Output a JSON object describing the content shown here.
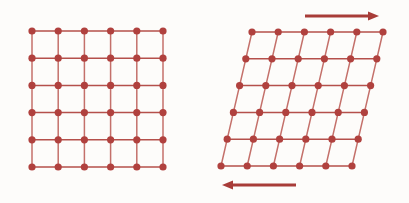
{
  "figure": {
    "background_color": "#fdfcfa",
    "width": 409,
    "height": 203,
    "panel_count": 2
  },
  "style": {
    "node_color": "#b0413e",
    "node_edge_color": "#8e302e",
    "bond_color": "#c4706a",
    "bond_color_strong": "#b5504b",
    "arrow_color": "#a83c38",
    "node_radius": 3.6,
    "bond_width": 1.5,
    "arrow_shaft_width": 3.2
  },
  "panels": [
    {
      "name": "undeformed-lattice",
      "label": "undeformed square lattice",
      "rows": 6,
      "cols": 6,
      "origin_x": 32,
      "origin_y": 31,
      "spacing_x": 26.2,
      "spacing_y": 27.2,
      "shear_offset_per_row": 0,
      "has_arrows": false
    },
    {
      "name": "sheared-lattice",
      "label": "sheared lattice",
      "rows": 6,
      "cols": 6,
      "origin_x": 221,
      "origin_y": 166,
      "spacing_x": 26.2,
      "spacing_y": -26.8,
      "shear_offset_per_row": 6.2,
      "has_arrows": true
    }
  ],
  "arrows": [
    {
      "name": "top-shear-arrow",
      "direction": "right",
      "x_start": 305,
      "x_end": 379,
      "y": 16,
      "label": "shear force applied to top, pointing right"
    },
    {
      "name": "bottom-shear-arrow",
      "direction": "left",
      "x_start": 296,
      "x_end": 222,
      "y": 185,
      "label": "shear force applied to bottom, pointing left"
    }
  ]
}
